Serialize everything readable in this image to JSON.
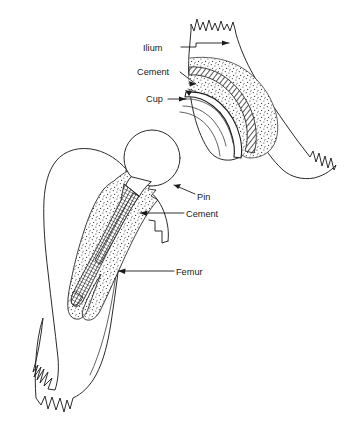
{
  "figure": {
    "background_color": "#ffffff",
    "line_color": "#2b2b2b",
    "text_color": "#1a1a1a"
  },
  "annotations": [
    {
      "id": "ilium",
      "label": "Ilium",
      "text_x": 143,
      "text_y": 51,
      "target": "pelvis-ilium-body",
      "leader": "M181,47 L196,47 L196,43 L229,43",
      "arrow": "M229,43 l-7,-2.6 l0,5.2 z"
    },
    {
      "id": "cement-pelvis",
      "label": "Cement",
      "text_x": 137,
      "text_y": 75,
      "target": "acetabular-cement-layer",
      "leader": "M180,72 L196,84",
      "arrow": "M196,84 l-6.6,-3.2 l1.0,5.2 z"
    },
    {
      "id": "cup",
      "label": "Cup",
      "text_x": 146,
      "text_y": 102,
      "target": "acetabular-cup",
      "leader": "M168,99 L186,99",
      "arrow": "M186,99 l-7,-2.6 l0,5.2 z"
    },
    {
      "id": "pin",
      "label": "Pin",
      "text_x": 197,
      "text_y": 200,
      "target": "prosthesis-pin-neck",
      "leader": "M195,194 L174,185",
      "arrow": "M174,185 l6.8,-1.2 l-2.6,4.8 z"
    },
    {
      "id": "cement-femur",
      "label": "Cement",
      "text_x": 186,
      "text_y": 217,
      "target": "femoral-cement-mantle",
      "leader": "M184,213 L140,213",
      "arrow": "M140,213 l7.2,-2.4 l-0.4,5.2 z"
    },
    {
      "id": "femur",
      "label": "Femur",
      "text_x": 176,
      "text_y": 275,
      "target": "femur-cortex",
      "leader": "M174,271 L118,271",
      "arrow": "M118,271 l7.4,-2.4 l-0.4,5.2 z"
    }
  ],
  "structures": {
    "pelvis": {
      "name": "Ilium / pelvic bone",
      "broken_edge_top": "jagged",
      "broken_edge_lower_right": "jagged"
    },
    "acetabulum": {
      "name": "Acetabulum",
      "layers": [
        "cancellous-bone-stipple",
        "cement-hatch",
        "cup-white"
      ]
    },
    "femur": {
      "name": "Proximal femur",
      "broken_edge_bottom": "jagged",
      "parts": [
        "greater-trochanter",
        "femoral-shaft",
        "medullary-canal"
      ]
    },
    "prosthesis": {
      "name": "Femoral prosthesis",
      "parts": [
        "head-ball",
        "neck-pin",
        "stem-hatched"
      ]
    }
  }
}
